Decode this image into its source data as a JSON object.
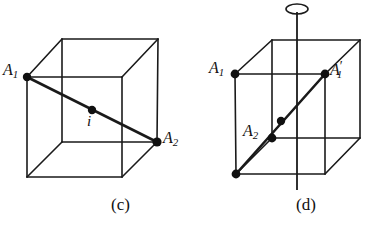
{
  "figure": {
    "type": "geometry-diagram",
    "background_color": "#ffffff",
    "stroke_color": "#1a1a1a",
    "panels": [
      {
        "id": "c",
        "caption": "(c)",
        "description": "cube with body diagonal and inversion centre",
        "labels": [
          {
            "name": "A1",
            "base": "A",
            "sub": "1",
            "prime": ""
          },
          {
            "name": "A2",
            "base": "A",
            "sub": "2",
            "prime": ""
          },
          {
            "name": "i",
            "base": "i",
            "sub": "",
            "prime": ""
          }
        ],
        "marked_points": [
          {
            "label": "A1",
            "x": 27,
            "y": 77
          },
          {
            "label": "i",
            "x": 92,
            "y": 110
          },
          {
            "label": "A2",
            "x": 157,
            "y": 142
          }
        ],
        "cube_vertices": {
          "front_top_left": [
            27,
            77
          ],
          "front_top_right": [
            122,
            77
          ],
          "front_bottom_left": [
            27,
            177
          ],
          "front_bottom_right": [
            122,
            177
          ],
          "back_top_left": [
            62,
            39
          ],
          "back_top_right": [
            158,
            39
          ],
          "back_bottom_left": [
            62,
            142
          ],
          "back_bottom_right": [
            157,
            142
          ]
        }
      },
      {
        "id": "d",
        "caption": "(d)",
        "description": "cube with vertical rotation axis and face diagonal",
        "labels": [
          {
            "name": "A1",
            "base": "A",
            "sub": "1",
            "prime": ""
          },
          {
            "name": "A1p",
            "base": "A",
            "sub": "1",
            "prime": "′"
          },
          {
            "name": "A2",
            "base": "A",
            "sub": "2",
            "prime": ""
          }
        ],
        "marked_points": [
          {
            "label": "A1",
            "x": 235,
            "y": 74
          },
          {
            "label": "A1p",
            "x": 325,
            "y": 74
          },
          {
            "label": "center",
            "x": 280,
            "y": 120
          },
          {
            "label": "A2",
            "x": 272,
            "y": 138
          },
          {
            "label": "corner",
            "x": 236,
            "y": 174
          }
        ],
        "cube_vertices": {
          "front_top_left": [
            235,
            74
          ],
          "front_top_right": [
            325,
            74
          ],
          "front_bottom_left": [
            236,
            174
          ],
          "front_bottom_right": [
            325,
            174
          ],
          "back_top_left": [
            272,
            40
          ],
          "back_top_right": [
            360,
            40
          ],
          "back_bottom_left": [
            272,
            138
          ],
          "back_bottom_right": [
            360,
            138
          ]
        },
        "rotation_axis": {
          "symbol": "ellipse",
          "x": 297,
          "top_y": 14,
          "bottom_y": 190,
          "ellipse_center_x": 297,
          "ellipse_center_y": 9,
          "ellipse_rx": 11,
          "ellipse_ry": 5
        }
      }
    ]
  },
  "labels": {
    "c": {
      "A1_base": "A",
      "A1_sub": "1",
      "A2_base": "A",
      "A2_sub": "2",
      "i": "i",
      "caption": "(c)"
    },
    "d": {
      "A1_base": "A",
      "A1_sub": "1",
      "A1p_base": "A",
      "A1p_sub": "1",
      "A1p_prime": "′",
      "A2_base": "A",
      "A2_sub": "2",
      "caption": "(d)"
    }
  }
}
